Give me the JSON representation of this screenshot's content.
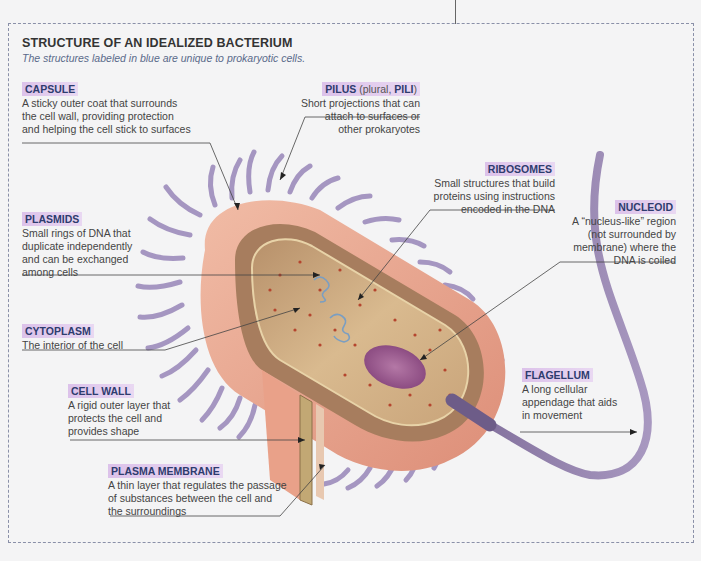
{
  "header": {
    "title": "STRUCTURE OF AN IDEALIZED BACTERIUM",
    "subtitle": "The structures labeled in blue are unique to prokaryotic cells."
  },
  "labels": {
    "capsule": {
      "heading": "CAPSULE",
      "description": "A sticky outer coat that surrounds the cell wall, providing protection and helping the cell stick to surfaces"
    },
    "pilus": {
      "heading": "PILUS",
      "heading_note": "(plural,",
      "heading_plural": "PILI",
      "heading_close": ")",
      "description": "Short projections that can attach to surfaces or other prokaryotes"
    },
    "ribosomes": {
      "heading": "RIBOSOMES",
      "description": "Small structures that build proteins using instructions encoded in the DNA"
    },
    "plasmids": {
      "heading": "PLASMIDS",
      "description": "Small rings of DNA that duplicate independently and can be exchanged among cells"
    },
    "nucleoid": {
      "heading": "NUCLEOID",
      "description": "A “nucleus-like” region (not surrounded by membrane) where the DNA is coiled"
    },
    "cytoplasm": {
      "heading": "CYTOPLASM",
      "description": "The interior of the cell"
    },
    "flagellum": {
      "heading": "FLAGELLUM",
      "description": "A long cellular appendage that aids in movement"
    },
    "cell_wall": {
      "heading": "CELL WALL",
      "description": "A rigid outer layer that protects the cell and provides shape"
    },
    "plasma_membrane": {
      "heading": "PLASMA MEMBRANE",
      "description": "A thin layer that regulates the passage of substances between the cell and the surroundings"
    }
  },
  "colors": {
    "heading_text": "#2e3c6e",
    "heading_highlight": "#dcc2ea",
    "pili": "#9b8ab8",
    "capsule": "#e8a68e",
    "cytoplasm": "#cfae85",
    "nucleoid": "#9a5a8a",
    "flagellum": "#8d7aa6",
    "frame": "#8a90a8"
  }
}
